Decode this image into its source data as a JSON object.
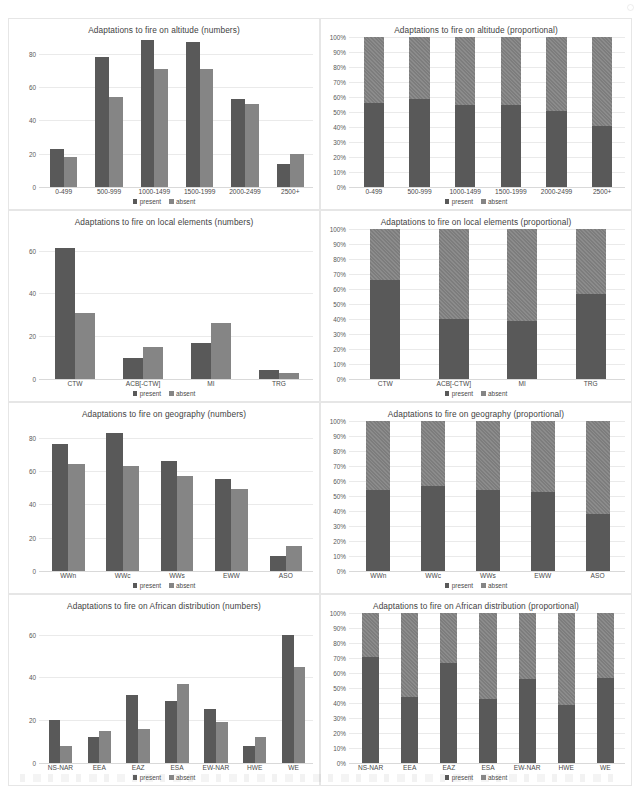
{
  "legend": {
    "present": "present",
    "absent": "absent"
  },
  "chart_data": [
    {
      "type": "bar",
      "title": "Adaptations to fire on altitude (numbers)",
      "xlabel": "",
      "ylabel": "",
      "ylim": [
        0,
        90
      ],
      "yticks": [
        0,
        20,
        40,
        60,
        80
      ],
      "ytick_labels": [
        "0",
        "20",
        "40",
        "60",
        "80"
      ],
      "grid": true,
      "legend_position": "bottom",
      "categories": [
        "0-499",
        "500-999",
        "1000-1499",
        "1500-1999",
        "2000-2499",
        "2500+"
      ],
      "series": [
        {
          "name": "present",
          "values": [
            23,
            78,
            88,
            87,
            53,
            14
          ]
        },
        {
          "name": "absent",
          "values": [
            18,
            54,
            71,
            71,
            50,
            20
          ]
        }
      ]
    },
    {
      "type": "bar",
      "title": "Adaptations to fire on altitude (proportional)",
      "xlabel": "",
      "ylabel": "",
      "ylim": [
        0,
        100
      ],
      "yticks": [
        0,
        10,
        20,
        30,
        40,
        50,
        60,
        70,
        80,
        90,
        100
      ],
      "ytick_labels": [
        "0%",
        "10%",
        "20%",
        "30%",
        "40%",
        "50%",
        "60%",
        "70%",
        "80%",
        "90%",
        "100%"
      ],
      "grid": true,
      "stacked": true,
      "legend_position": "bottom",
      "categories": [
        "0-499",
        "500-999",
        "1000-1499",
        "1500-1999",
        "2000-2499",
        "2500+"
      ],
      "series": [
        {
          "name": "present",
          "values": [
            56,
            59,
            55,
            55,
            51,
            41
          ]
        },
        {
          "name": "absent",
          "values": [
            44,
            41,
            45,
            45,
            49,
            59
          ]
        }
      ]
    },
    {
      "type": "bar",
      "title": "Adaptations to fire on local elements (numbers)",
      "xlabel": "",
      "ylabel": "",
      "ylim": [
        0,
        70
      ],
      "yticks": [
        0,
        20,
        40,
        60
      ],
      "ytick_labels": [
        "0",
        "20",
        "40",
        "60"
      ],
      "grid": true,
      "legend_position": "bottom",
      "categories": [
        "CTW",
        "ACB[-CTW]",
        "MI",
        "TRG"
      ],
      "series": [
        {
          "name": "present",
          "values": [
            61,
            10,
            17,
            4
          ]
        },
        {
          "name": "absent",
          "values": [
            31,
            15,
            26,
            3
          ]
        }
      ]
    },
    {
      "type": "bar",
      "title": "Adaptations to fire on local elements (proportional)",
      "xlabel": "",
      "ylabel": "",
      "ylim": [
        0,
        100
      ],
      "yticks": [
        0,
        10,
        20,
        30,
        40,
        50,
        60,
        70,
        80,
        90,
        100
      ],
      "ytick_labels": [
        "0%",
        "10%",
        "20%",
        "30%",
        "40%",
        "50%",
        "60%",
        "70%",
        "80%",
        "90%",
        "100%"
      ],
      "grid": true,
      "stacked": true,
      "legend_position": "bottom",
      "categories": [
        "CTW",
        "ACB[-CTW]",
        "MI",
        "TRG"
      ],
      "series": [
        {
          "name": "present",
          "values": [
            66,
            40,
            39,
            57
          ]
        },
        {
          "name": "absent",
          "values": [
            34,
            60,
            61,
            43
          ]
        }
      ]
    },
    {
      "type": "bar",
      "title": "Adaptations to fire on geography (numbers)",
      "xlabel": "",
      "ylabel": "",
      "ylim": [
        0,
        90
      ],
      "yticks": [
        0,
        20,
        40,
        60,
        80
      ],
      "ytick_labels": [
        "0",
        "20",
        "40",
        "60",
        "80"
      ],
      "grid": true,
      "legend_position": "bottom",
      "categories": [
        "WWn",
        "WWc",
        "WWs",
        "EWW",
        "ASO"
      ],
      "series": [
        {
          "name": "present",
          "values": [
            76,
            83,
            66,
            55,
            9
          ]
        },
        {
          "name": "absent",
          "values": [
            64,
            63,
            57,
            49,
            15
          ]
        }
      ]
    },
    {
      "type": "bar",
      "title": "Adaptations to fire on geography (proportional)",
      "xlabel": "",
      "ylabel": "",
      "ylim": [
        0,
        100
      ],
      "yticks": [
        0,
        10,
        20,
        30,
        40,
        50,
        60,
        70,
        80,
        90,
        100
      ],
      "ytick_labels": [
        "0%",
        "10%",
        "20%",
        "30%",
        "40%",
        "50%",
        "60%",
        "70%",
        "80%",
        "90%",
        "100%"
      ],
      "grid": true,
      "stacked": true,
      "legend_position": "bottom",
      "categories": [
        "WWn",
        "WWc",
        "WWs",
        "EWW",
        "ASO"
      ],
      "series": [
        {
          "name": "present",
          "values": [
            54,
            57,
            54,
            53,
            38
          ]
        },
        {
          "name": "absent",
          "values": [
            46,
            43,
            46,
            47,
            62
          ]
        }
      ]
    },
    {
      "type": "bar",
      "title": "Adaptations to fire on African distribution (numbers)",
      "xlabel": "",
      "ylabel": "",
      "ylim": [
        0,
        70
      ],
      "yticks": [
        0,
        20,
        40,
        60
      ],
      "ytick_labels": [
        "0",
        "20",
        "40",
        "60"
      ],
      "grid": true,
      "legend_position": "bottom",
      "categories": [
        "NS-NAR",
        "EEA",
        "EAZ",
        "ESA",
        "EW-NAR",
        "HWE",
        "WE"
      ],
      "series": [
        {
          "name": "present",
          "values": [
            20,
            12,
            32,
            29,
            25,
            8,
            60
          ]
        },
        {
          "name": "absent",
          "values": [
            8,
            15,
            16,
            37,
            19,
            12,
            45
          ]
        }
      ]
    },
    {
      "type": "bar",
      "title": "Adaptations to fire on African distribution (proportional)",
      "xlabel": "",
      "ylabel": "",
      "ylim": [
        0,
        100
      ],
      "yticks": [
        0,
        10,
        20,
        30,
        40,
        50,
        60,
        70,
        80,
        90,
        100
      ],
      "ytick_labels": [
        "0%",
        "10%",
        "20%",
        "30%",
        "40%",
        "50%",
        "60%",
        "70%",
        "80%",
        "90%",
        "100%"
      ],
      "grid": true,
      "stacked": true,
      "legend_position": "bottom",
      "categories": [
        "NS-NAR",
        "EEA",
        "EAZ",
        "ESA",
        "EW-NAR",
        "HWE",
        "WE"
      ],
      "series": [
        {
          "name": "present",
          "values": [
            71,
            44,
            67,
            43,
            56,
            39,
            57
          ]
        },
        {
          "name": "absent",
          "values": [
            29,
            56,
            33,
            57,
            44,
            61,
            43
          ]
        }
      ]
    }
  ]
}
